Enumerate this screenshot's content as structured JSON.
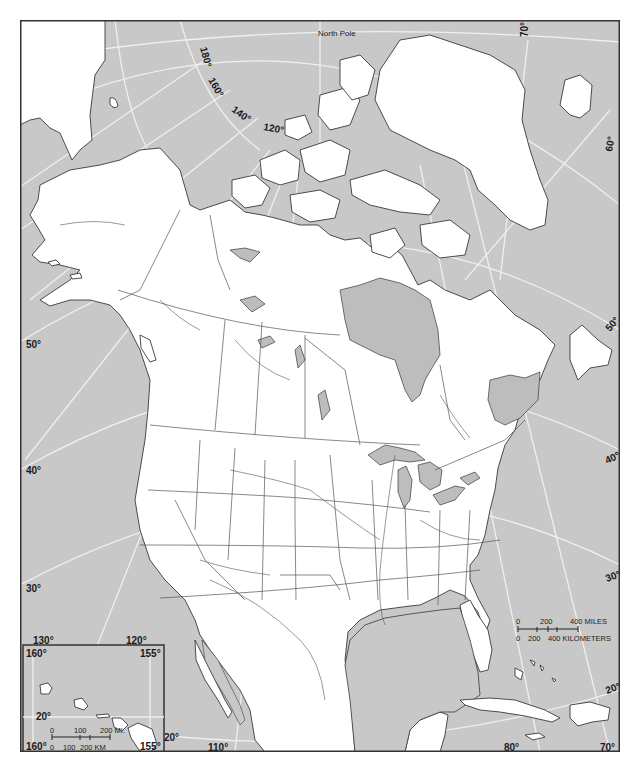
{
  "map": {
    "title_label": "North Pole",
    "projection_note": "Polar-style conic projection of North America",
    "colors": {
      "ocean": "#c8c8c8",
      "land": "#ffffff",
      "water_bodies": "#bdbdbd",
      "graticule": "#efefef",
      "outline": "#3a3a3a"
    },
    "longitude_labels": {
      "top_180": "180°",
      "top_160": "160°",
      "top_140": "140°",
      "top_120": "120°",
      "top_70": "70°",
      "bottom_130": "130°",
      "bottom_120": "120°",
      "bottom_110": "110°",
      "bottom_80": "80°",
      "bottom_70": "70°"
    },
    "latitude_labels": {
      "left_50": "50°",
      "left_40": "40°",
      "left_30": "30°",
      "left_20": "20°",
      "right_60": "60°",
      "right_50": "50°",
      "right_40": "40°",
      "right_30": "30°",
      "right_20": "20°"
    },
    "scale_bar": {
      "miles_ticks": [
        "0",
        "200",
        "400 MILES"
      ],
      "km_ticks": [
        "0",
        "200",
        "400 KILOMETERS"
      ]
    },
    "inset_hawaii": {
      "corner_top_left": "160°",
      "corner_top_right": "155°",
      "corner_bottom_left": "160°",
      "corner_bottom_right": "155°",
      "lat_label": "20°",
      "scale_miles": [
        "0",
        "100",
        "200 MI."
      ],
      "scale_km": [
        "0",
        "100",
        "200 KM"
      ]
    }
  }
}
